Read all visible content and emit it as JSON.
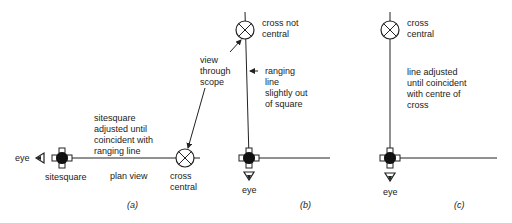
{
  "panels": {
    "a": {
      "caption": "(a)",
      "eye_label": "eye",
      "sitesquare_label": "sitesquare",
      "plan_view_label": "plan view",
      "cross_label": "cross\ncentral",
      "adjust_note": "sitesquare\nadjusted until\ncoincident with\nranging line",
      "scope_note": "view\nthrough\nscope"
    },
    "b": {
      "caption": "(b)",
      "eye_label": "eye",
      "cross_label": "cross not\ncentral",
      "ranging_note": "ranging\nline\nslightly out\nof square"
    },
    "c": {
      "caption": "(c)",
      "eye_label": "eye",
      "cross_label": "cross\ncentral",
      "adjust_note": "line adjusted\nuntil coincident\nwith centre of\ncross"
    }
  },
  "colors": {
    "ink": "#222222",
    "background": "#ffffff"
  }
}
